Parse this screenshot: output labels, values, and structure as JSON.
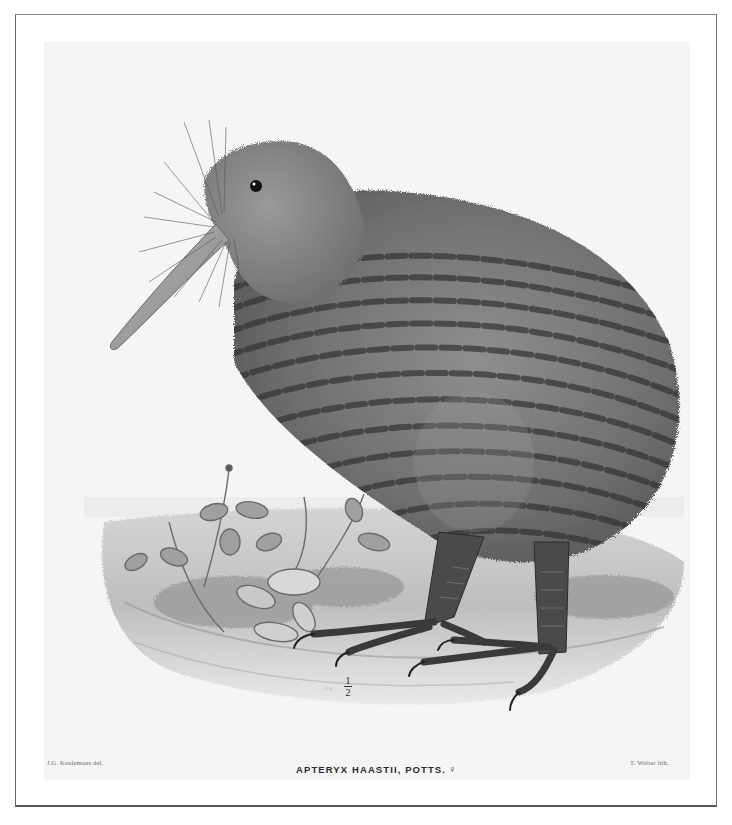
{
  "plate": {
    "subject": "kiwi bird standing on mossy ground beside small leafy plants",
    "caption": {
      "species": "APTERYX HAASTII, POTTS.",
      "sex_symbol": "♀"
    },
    "scale": {
      "numerator": "1",
      "denominator": "2"
    },
    "credits": {
      "delineator": "J.G. Keulemans del.",
      "lithographer": "T. Walter lith."
    },
    "artist_initials": "J.G.K."
  },
  "colors": {
    "paper": "#ffffff",
    "plate_background": "#f5f5f5",
    "plumage_light": "#8e8e8e",
    "plumage_dark": "#3e3e3e",
    "legs": "#4a4a4a",
    "frame": "#6a6a6a"
  }
}
